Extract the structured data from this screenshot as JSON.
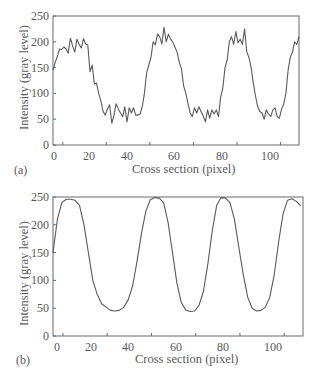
{
  "chart_data": [
    {
      "panel": "(a)",
      "type": "line",
      "title": "",
      "xlabel": "Cross section (pixel)",
      "ylabel": "Intensity (gray level)",
      "xlim": [
        0,
        113
      ],
      "ylim": [
        0,
        250
      ],
      "xticks": [
        0,
        20,
        40,
        60,
        80,
        100
      ],
      "yticks": [
        0,
        50,
        100,
        150,
        200,
        250
      ],
      "grid": false,
      "legend": null,
      "series": [
        {
          "name": "noisy intensity profile",
          "x": [
            0,
            1,
            2,
            3,
            4,
            5,
            6,
            7,
            8,
            9,
            10,
            11,
            12,
            13,
            14,
            15,
            16,
            17,
            18,
            19,
            20,
            21,
            22,
            23,
            24,
            25,
            26,
            27,
            28,
            29,
            30,
            31,
            32,
            33,
            34,
            35,
            36,
            37,
            38,
            39,
            40,
            41,
            42,
            43,
            44,
            45,
            46,
            47,
            48,
            49,
            50,
            51,
            52,
            53,
            54,
            55,
            56,
            57,
            58,
            59,
            60,
            61,
            62,
            63,
            64,
            65,
            66,
            67,
            68,
            69,
            70,
            71,
            72,
            73,
            74,
            75,
            76,
            77,
            78,
            79,
            80,
            81,
            82,
            83,
            84,
            85,
            86,
            87,
            88,
            89,
            90,
            91,
            92,
            93,
            94,
            95,
            96,
            97,
            98,
            99,
            100,
            101,
            102,
            103,
            104,
            105,
            106,
            107,
            108,
            109,
            110,
            111,
            112,
            113
          ],
          "values": [
            145,
            160,
            172,
            186,
            185,
            190,
            186,
            178,
            207,
            192,
            180,
            205,
            195,
            188,
            206,
            196,
            194,
            142,
            155,
            118,
            120,
            100,
            85,
            65,
            58,
            70,
            78,
            42,
            58,
            80,
            70,
            62,
            55,
            74,
            45,
            72,
            62,
            72,
            58,
            58,
            60,
            75,
            100,
            140,
            155,
            170,
            200,
            194,
            215,
            210,
            196,
            228,
            200,
            215,
            205,
            200,
            190,
            180,
            160,
            148,
            115,
            100,
            80,
            62,
            55,
            72,
            62,
            74,
            65,
            56,
            45,
            68,
            52,
            68,
            60,
            68,
            55,
            92,
            110,
            150,
            165,
            200,
            210,
            195,
            220,
            198,
            205,
            195,
            225,
            180,
            170,
            150,
            120,
            95,
            75,
            65,
            62,
            50,
            68,
            60,
            55,
            68,
            72,
            55,
            52,
            70,
            80,
            100,
            145,
            170,
            180,
            200,
            195,
            210
          ]
        }
      ]
    },
    {
      "panel": "(b)",
      "type": "line",
      "title": "",
      "xlabel": "Cross section (pixel)",
      "ylabel": "Intensity (gray level)",
      "xlim": [
        0,
        113
      ],
      "ylim": [
        0,
        250
      ],
      "xticks": [
        0,
        20,
        40,
        60,
        80,
        100
      ],
      "yticks": [
        0,
        50,
        100,
        150,
        200,
        250
      ],
      "grid": false,
      "legend": null,
      "series": [
        {
          "name": "smoothed intensity profile",
          "x": [
            0,
            2,
            4,
            6,
            8,
            10,
            12,
            14,
            16,
            18,
            20,
            22,
            24,
            26,
            28,
            30,
            32,
            34,
            36,
            38,
            40,
            42,
            44,
            46,
            48,
            50,
            52,
            54,
            56,
            58,
            60,
            62,
            64,
            66,
            68,
            70,
            72,
            74,
            76,
            78,
            80,
            82,
            84,
            86,
            88,
            90,
            92,
            94,
            96,
            98,
            100,
            102,
            104,
            106,
            108,
            110,
            112
          ],
          "values": [
            150,
            210,
            240,
            246,
            246,
            244,
            235,
            200,
            150,
            100,
            75,
            58,
            52,
            46,
            45,
            46,
            52,
            65,
            90,
            135,
            185,
            225,
            245,
            249,
            248,
            240,
            205,
            150,
            95,
            60,
            47,
            44,
            45,
            55,
            80,
            130,
            190,
            235,
            249,
            248,
            240,
            210,
            160,
            110,
            70,
            50,
            45,
            46,
            52,
            70,
            110,
            170,
            220,
            244,
            247,
            242,
            234
          ]
        }
      ]
    }
  ],
  "figures": {
    "a": {
      "panel_label": "(a)",
      "xlabel": "Cross section (pixel)",
      "ylabel": "Intensity (gray level)",
      "xtick_labels": [
        "0",
        "20",
        "40",
        "60",
        "80",
        "100"
      ],
      "ytick_labels": [
        "0",
        "50",
        "100",
        "150",
        "200",
        "250"
      ]
    },
    "b": {
      "panel_label": "(b)",
      "xlabel": "Cross section (pixel)",
      "ylabel": "Intensity (gray level)",
      "xtick_labels": [
        "0",
        "20",
        "40",
        "60",
        "80",
        "100"
      ],
      "ytick_labels": [
        "0",
        "50",
        "100",
        "150",
        "200",
        "250"
      ]
    }
  },
  "style": {
    "line_color": "#5a5a5a",
    "axis_color": "#6a6a6a",
    "text_color": "#5a5a5a",
    "background": "#ffffff"
  }
}
